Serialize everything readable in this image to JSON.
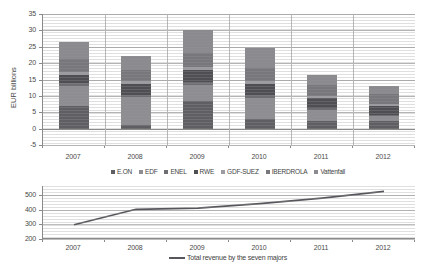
{
  "chart_data": [
    {
      "type": "bar",
      "stacked": true,
      "title": "",
      "xlabel": "",
      "ylabel": "EUR billions",
      "categories": [
        "2007",
        "2008",
        "2009",
        "2010",
        "2011",
        "2012"
      ],
      "ylim": [
        -5,
        35
      ],
      "yticks": [
        -5,
        0,
        5,
        10,
        15,
        20,
        25,
        30,
        35
      ],
      "grid": true,
      "legend_position": "bottom",
      "series": [
        {
          "name": "E.ON",
          "color": "#5f5f63",
          "values": [
            7.0,
            1.0,
            8.3,
            3.0,
            2.4,
            2.2
          ]
        },
        {
          "name": "EDF",
          "color": "#8e8e92",
          "values": [
            5.9,
            8.7,
            5.0,
            6.5,
            3.2,
            1.6
          ]
        },
        {
          "name": "ENEL",
          "color": "#6d6d72",
          "values": [
            0.9,
            0.6,
            0.9,
            0.7,
            0.6,
            0.5
          ]
        },
        {
          "name": "RWE",
          "color": "#4e4e53",
          "values": [
            2.5,
            3.2,
            3.7,
            3.4,
            3.0,
            2.5
          ]
        },
        {
          "name": "GDF-SUEZ",
          "color": "#9d9da1",
          "values": [
            1.0,
            0.9,
            1.0,
            0.9,
            0.8,
            0.7
          ]
        },
        {
          "name": "IBERDROLA",
          "color": "#77777c",
          "values": [
            4.0,
            3.4,
            4.1,
            4.0,
            3.3,
            3.1
          ]
        },
        {
          "name": "Vattenfall",
          "color": "#8a8a8f",
          "values": [
            5.0,
            4.4,
            7.0,
            6.0,
            3.1,
            2.4
          ]
        }
      ],
      "totals": [
        26.3,
        22.2,
        30.0,
        24.5,
        16.4,
        13.0
      ]
    },
    {
      "type": "line",
      "title": "",
      "xlabel": "",
      "ylabel": "EUR billions",
      "categories": [
        "2007",
        "2008",
        "2009",
        "2010",
        "2011",
        "2012"
      ],
      "ylim": [
        200,
        560
      ],
      "yticks": [
        200,
        300,
        400,
        500
      ],
      "grid": true,
      "legend_position": "bottom",
      "series": [
        {
          "name": "Total revenue by the seven majors",
          "color": "#56565c",
          "values": [
            297,
            402,
            409,
            440,
            478,
            523
          ]
        }
      ]
    }
  ],
  "panel1": {
    "ylabel": "EUR billions"
  },
  "panel2": {
    "ylabel": "EUR billions"
  }
}
